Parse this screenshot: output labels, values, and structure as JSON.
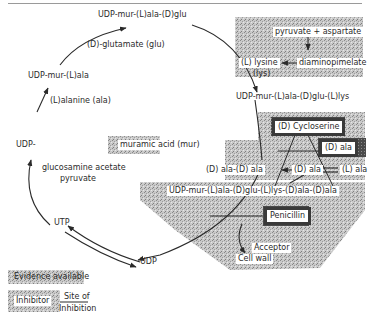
{
  "diagram": {
    "nodes": {
      "udp_mur_ala_glu": "UDP-mur-(L)ala-(D)glu",
      "udp_mur_ala": "UDP-mur-(L)ala",
      "udp": "UDP-",
      "muramic_acid": "muramic acid (mur)",
      "udp_mur_ala_glu_lys": "UDP-mur-(L)ala-(D)glu-(L)lys",
      "pentapeptide": "UDP-mur-(L)ala-(D)glu-(L)lys-(D)ala-(D)ala",
      "utp": "UTP",
      "udp_end": "UDP",
      "pyruvate_aspartate": "pyruvate + aspartate",
      "lysine": "(L) lysine",
      "lys": "(lys)",
      "diaminopimelate": "diaminopimelate",
      "d_ala_d_ala": "(D) ala-(D) ala",
      "d_ala": "(D) ala",
      "l_ala": "(L) ala",
      "acceptor": "Acceptor",
      "cell_wall": "Cell wall"
    },
    "edge_labels": {
      "glutamate": "(D)-glutamate (glu)",
      "alanine": "(L)alanine (ala)",
      "precursors_line1": "glucosamine acetate",
      "precursors_line2": "pyruvate"
    },
    "inhibitors": {
      "cycloserine": "(D) Cycloserine",
      "d_ala_inhib": "(D) ala",
      "penicillin": "Penicillin"
    },
    "legend": {
      "evidence": "Evidence available",
      "inhibitor": "Inhibitor",
      "site_line1": "Site of",
      "site_line2": "Inhibition"
    },
    "colors": {
      "shading": "#b8b8b8",
      "inhibitor_border": "#3a3a3a",
      "line": "#2a2a2a"
    }
  }
}
